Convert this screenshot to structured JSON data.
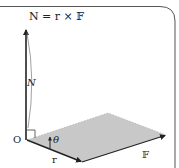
{
  "diagram": {
    "title": "N = r × 𝔽",
    "labels": {
      "torque": "N",
      "origin": "O",
      "angle": "θ",
      "position": "r",
      "force": "𝔽"
    },
    "colors": {
      "stroke": "#222222",
      "plane_fill": "#c8c8c8",
      "frame": "#555555",
      "background": "#ffffff"
    },
    "elements": [
      "torque vector N (vertical, perpendicular to plane)",
      "position vector r",
      "force vector F",
      "shaded plane spanned by r and F",
      "right-angle marker at origin",
      "rotation arrow theta"
    ]
  }
}
